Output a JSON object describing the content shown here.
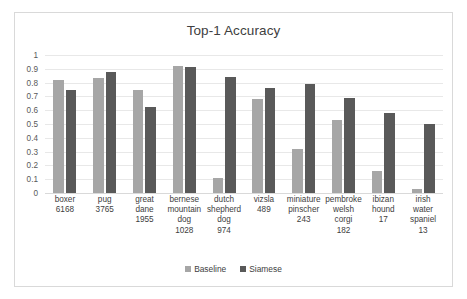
{
  "chart_data": {
    "type": "bar",
    "title": "Top-1 Accuracy",
    "xlabel": "",
    "ylabel": "",
    "ylim": [
      0,
      1
    ],
    "yticks": [
      "1",
      "0.9",
      "0.8",
      "0.7",
      "0.6",
      "0.5",
      "0.4",
      "0.3",
      "0.2",
      "0.1",
      "0"
    ],
    "ytick_values": [
      1,
      0.9,
      0.8,
      0.7,
      0.6,
      0.5,
      0.4,
      0.3,
      0.2,
      0.1,
      0
    ],
    "grid": true,
    "legend_position": "bottom",
    "categories": [
      "boxer",
      "pug",
      "great dane",
      "bernese mountain dog",
      "dutch shepherd dog",
      "vizsla",
      "miniature pinscher",
      "pembroke welsh corgi",
      "ibizan hound",
      "irish water spaniel"
    ],
    "category_lines": [
      [
        "boxer",
        "6168"
      ],
      [
        "pug",
        "3765"
      ],
      [
        "great",
        "dane",
        "1955"
      ],
      [
        "bernese",
        "mountain",
        "dog",
        "1028"
      ],
      [
        "dutch",
        "shepherd",
        "dog",
        "974"
      ],
      [
        "vizsla",
        "489"
      ],
      [
        "miniature",
        "pinscher",
        "243"
      ],
      [
        "pembroke",
        "welsh",
        "corgi",
        "182"
      ],
      [
        "ibizan",
        "hound",
        "17"
      ],
      [
        "irish",
        "water",
        "spaniel",
        "13"
      ]
    ],
    "category_counts": [
      6168,
      3765,
      1955,
      1028,
      974,
      489,
      243,
      182,
      17,
      13
    ],
    "series": [
      {
        "name": "Baseline",
        "color": "#a6a6a6",
        "values": [
          0.82,
          0.83,
          0.75,
          0.92,
          0.11,
          0.68,
          0.32,
          0.53,
          0.16,
          0.03
        ]
      },
      {
        "name": "Siamese",
        "color": "#595959",
        "values": [
          0.75,
          0.88,
          0.62,
          0.91,
          0.84,
          0.76,
          0.79,
          0.69,
          0.58,
          0.5
        ]
      }
    ]
  },
  "legend": {
    "entries": [
      {
        "label": "Baseline"
      },
      {
        "label": "Siamese"
      }
    ]
  },
  "colors": {
    "baseline": "#a6a6a6",
    "siamese": "#595959",
    "grid": "#e8e8e8",
    "frame": "#d9d9d9",
    "text": "#404040"
  }
}
